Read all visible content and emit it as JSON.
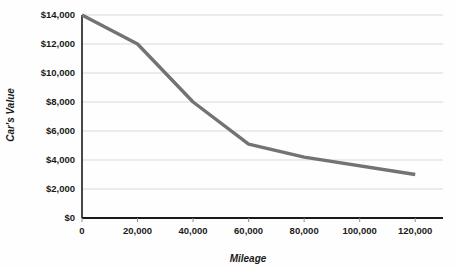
{
  "chart_data": {
    "type": "line",
    "title": "",
    "xlabel": "Mileage",
    "ylabel": "Car's Value",
    "xlim": [
      0,
      130000
    ],
    "ylim": [
      0,
      14000
    ],
    "grid": true,
    "legend": "none",
    "series_color": "#737373",
    "gridline_color": "#d9d9d9",
    "axis_color": "#1a1a1a",
    "x_tick_labels": [
      "0",
      "20,000",
      "40,000",
      "60,000",
      "80,000",
      "100,000",
      "120,000"
    ],
    "x_tick_values": [
      0,
      20000,
      40000,
      60000,
      80000,
      100000,
      120000
    ],
    "y_tick_labels": [
      "$0",
      "$2,000",
      "$4,000",
      "$6,000",
      "$8,000",
      "$10,000",
      "$12,000",
      "$14,000"
    ],
    "y_tick_values": [
      0,
      2000,
      4000,
      6000,
      8000,
      10000,
      12000,
      14000
    ],
    "series": [
      {
        "name": "Car's Value",
        "x": [
          0,
          20000,
          40000,
          60000,
          80000,
          120000
        ],
        "values": [
          14000,
          12000,
          8000,
          5100,
          4200,
          3000
        ]
      }
    ]
  }
}
